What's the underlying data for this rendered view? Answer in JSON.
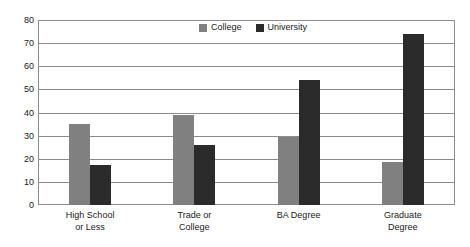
{
  "chart_data": {
    "type": "bar",
    "title": "",
    "xlabel": "",
    "ylabel": "",
    "ylim": [
      0,
      80
    ],
    "y_ticks": [
      0,
      10,
      20,
      30,
      40,
      50,
      60,
      70,
      80
    ],
    "grid": true,
    "legend_position": "top-center",
    "categories": [
      "High School\nor Less",
      "Trade or\nCollege",
      "BA Degree",
      "Graduate\nDegree"
    ],
    "category_lines": [
      [
        "High School",
        "or Less"
      ],
      [
        "Trade or",
        "College"
      ],
      [
        "BA Degree",
        ""
      ],
      [
        "Graduate",
        "Degree"
      ]
    ],
    "series": [
      {
        "name": "College",
        "color": "#808080",
        "values": [
          35,
          39,
          29.5,
          18.5
        ]
      },
      {
        "name": "University",
        "color": "#2b2b2b",
        "values": [
          17.5,
          26,
          54,
          74
        ]
      }
    ]
  },
  "legend": {
    "entries": [
      {
        "label": "College",
        "color": "#808080"
      },
      {
        "label": "University",
        "color": "#2b2b2b"
      }
    ]
  },
  "axis": {
    "y_tick_labels": [
      "80",
      "70",
      "60",
      "50",
      "40",
      "30",
      "20",
      "10",
      "0"
    ]
  },
  "colors": {
    "background": "#ffffff",
    "gridline": "#8c8c8c",
    "axis_text": "#1a1a1a",
    "college": "#808080",
    "university": "#2b2b2b"
  }
}
